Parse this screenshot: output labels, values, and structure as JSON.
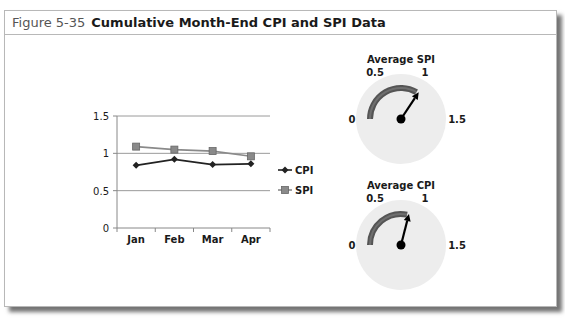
{
  "figure": {
    "number": "Figure 5-35",
    "title": "Cumulative Month-End CPI and SPI Data"
  },
  "chart_data": [
    {
      "type": "line",
      "title": "",
      "xlabel": "",
      "ylabel": "",
      "categories": [
        "Jan",
        "Feb",
        "Mar",
        "Apr"
      ],
      "series": [
        {
          "name": "CPI",
          "values": [
            0.84,
            0.92,
            0.85,
            0.86
          ],
          "color": "#222222",
          "marker": "diamond"
        },
        {
          "name": "SPI",
          "values": [
            1.09,
            1.05,
            1.03,
            0.96
          ],
          "color": "#8a8a8a",
          "marker": "square"
        }
      ],
      "yticks": [
        "0",
        "0.5",
        "1",
        "1.5"
      ],
      "ylim": [
        0,
        1.5
      ],
      "grid": true,
      "legend": {
        "position": "right",
        "entries": [
          "CPI",
          "SPI"
        ]
      }
    },
    {
      "type": "gauge",
      "title": "Average SPI",
      "value": 1.03,
      "range": [
        0,
        1.5
      ],
      "tick_labels": [
        "0",
        "0.5",
        "1",
        "1.5"
      ]
    },
    {
      "type": "gauge",
      "title": "Average CPI",
      "value": 0.87,
      "range": [
        0,
        1.5
      ],
      "tick_labels": [
        "0",
        "0.5",
        "1",
        "1.5"
      ]
    }
  ]
}
